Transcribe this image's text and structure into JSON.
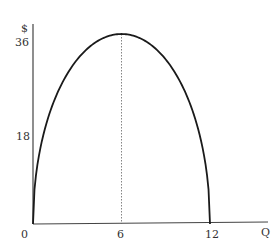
{
  "chart_data": {
    "type": "line",
    "title": "",
    "xlabel": "Q",
    "ylabel": "$",
    "x_ticks": [
      "0",
      "6",
      "12"
    ],
    "y_ticks": [
      "18",
      "36"
    ],
    "xlim": [
      0,
      13.5
    ],
    "ylim": [
      0,
      38
    ],
    "grid": false,
    "legend": null,
    "series": [
      {
        "name": "curve",
        "x": [
          0,
          0.25,
          0.5,
          1,
          1.5,
          2,
          3,
          4,
          5,
          6,
          7,
          8,
          9,
          10,
          10.5,
          11,
          11.5,
          11.75,
          12
        ],
        "y": [
          0,
          10.2,
          14.1,
          19.1,
          22.6,
          25.3,
          29.2,
          32.2,
          34.2,
          36,
          34.2,
          32.2,
          29.2,
          25.3,
          22.6,
          19.1,
          14.1,
          10.2,
          0
        ]
      }
    ],
    "annotations": [
      {
        "type": "dotted-vertical-line",
        "x": 6,
        "from_y": 0,
        "to_y": 36
      }
    ]
  },
  "labels": {
    "y_axis_symbol": "$",
    "y_tick_36": "36",
    "y_tick_18": "18",
    "origin": "0",
    "x_tick_6": "6",
    "x_tick_12": "12",
    "x_axis_symbol": "Q"
  }
}
